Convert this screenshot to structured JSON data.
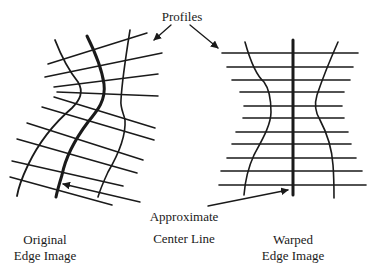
{
  "labels": {
    "profiles": "Profiles",
    "center_line_1": "Approximate",
    "center_line_2": "Center Line",
    "original_1": "Original",
    "original_2": "Edge Image",
    "warped_1": "Warped",
    "warped_2": "Edge Image"
  },
  "colors": {
    "ink": "#1a1a1a",
    "background": "#ffffff"
  }
}
